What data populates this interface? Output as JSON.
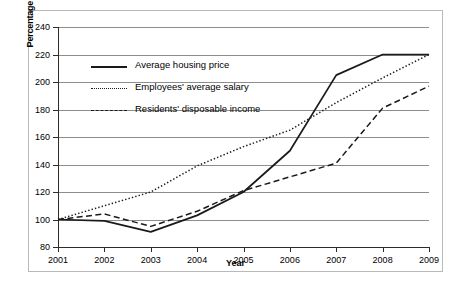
{
  "chart_data": {
    "type": "line",
    "title": "",
    "xlabel": "Year",
    "ylabel": "Percentage of 2001 value",
    "x": [
      2001,
      2002,
      2003,
      2004,
      2005,
      2006,
      2007,
      2008,
      2009
    ],
    "categories": [
      "2001",
      "2002",
      "2003",
      "2004",
      "2005",
      "2006",
      "2007",
      "2008",
      "2009"
    ],
    "xlim": [
      2001,
      2009
    ],
    "ylim": [
      80,
      240
    ],
    "yticks": [
      80,
      100,
      120,
      140,
      160,
      180,
      200,
      220,
      240
    ],
    "ytick_labels": [
      "80",
      "100",
      "120",
      "140",
      "160",
      "180",
      "200",
      "220",
      "240"
    ],
    "grid": "horizontal",
    "legend_position": "upper-left-inside",
    "series": [
      {
        "name": "Average housing price",
        "style": "solid",
        "color": "#1a1a1a",
        "values": [
          100,
          99,
          91,
          103,
          120,
          150,
          205,
          220,
          220
        ]
      },
      {
        "name": "Employees' average salary",
        "style": "dotted",
        "color": "#1a1a1a",
        "values": [
          100,
          110,
          120,
          139,
          153,
          165,
          185,
          203,
          220
        ]
      },
      {
        "name": "Residents' disposable income",
        "style": "dashed",
        "color": "#1a1a1a",
        "values": [
          100,
          104,
          95,
          106,
          121,
          131,
          141,
          181,
          197
        ]
      }
    ]
  },
  "axes": {
    "y_title": "Percentage of 2001 value",
    "x_title": "Year"
  },
  "legend": {
    "items": [
      {
        "label": "Average housing price",
        "style": "solid"
      },
      {
        "label": "Employees' average salary",
        "style": "dotted"
      },
      {
        "label": "Residents' disposable income",
        "style": "dashed"
      }
    ]
  }
}
